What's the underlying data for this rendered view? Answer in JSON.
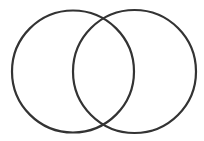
{
  "diagram": {
    "type": "venn",
    "background": "#ffffff",
    "stroke_color": "#333333",
    "stroke_width": 2.2,
    "circles": [
      {
        "name": "left",
        "cx": 73,
        "cy": 71.5,
        "r": 61
      },
      {
        "name": "right",
        "cx": 134.5,
        "cy": 71.5,
        "r": 61.5
      }
    ]
  }
}
